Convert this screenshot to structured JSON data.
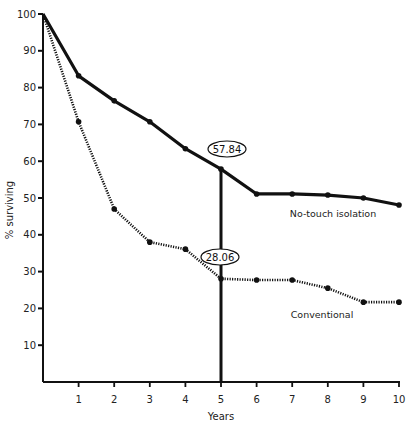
{
  "chart_data": {
    "type": "line",
    "title": "",
    "xlabel": "Years",
    "ylabel": "% surviving",
    "x": [
      0,
      1,
      2,
      3,
      4,
      5,
      6,
      7,
      8,
      9,
      10
    ],
    "xticks": [
      "1",
      "2",
      "3",
      "4",
      "5",
      "6",
      "7",
      "8",
      "9",
      "10"
    ],
    "yticks": [
      "10",
      "20",
      "30",
      "40",
      "50",
      "60",
      "70",
      "80",
      "90",
      "100"
    ],
    "xlim": [
      0,
      10
    ],
    "ylim": [
      0,
      100
    ],
    "grid": false,
    "legend": "inline labels",
    "series": [
      {
        "name": "No-touch isolation",
        "style": "solid",
        "values": [
          100,
          83.2,
          76.4,
          70.7,
          63.4,
          57.84,
          51.1,
          51.1,
          50.8,
          50.0,
          48.1
        ]
      },
      {
        "name": "Conventional",
        "style": "dotted",
        "values": [
          100,
          70.7,
          47.0,
          38.0,
          36.1,
          28.06,
          27.7,
          27.7,
          25.5,
          21.7,
          21.7
        ]
      }
    ],
    "annotations": [
      {
        "text": "57.84",
        "x": 5,
        "y": 57.84,
        "shape": "ellipse"
      },
      {
        "text": "28.06",
        "x": 5,
        "y": 28.06,
        "shape": "ellipse"
      },
      {
        "type": "vertical_line",
        "x": 5,
        "from": 0,
        "to": 57.84
      }
    ]
  },
  "labels": {
    "xlabel": "Years",
    "ylabel": "% surviving",
    "series_solid": "No-touch isolation",
    "series_dotted": "Conventional",
    "annot_solid": "57.84",
    "annot_dotted": "28.06"
  },
  "colors": {
    "line": "#111111",
    "text": "#222222",
    "background": "#ffffff"
  }
}
